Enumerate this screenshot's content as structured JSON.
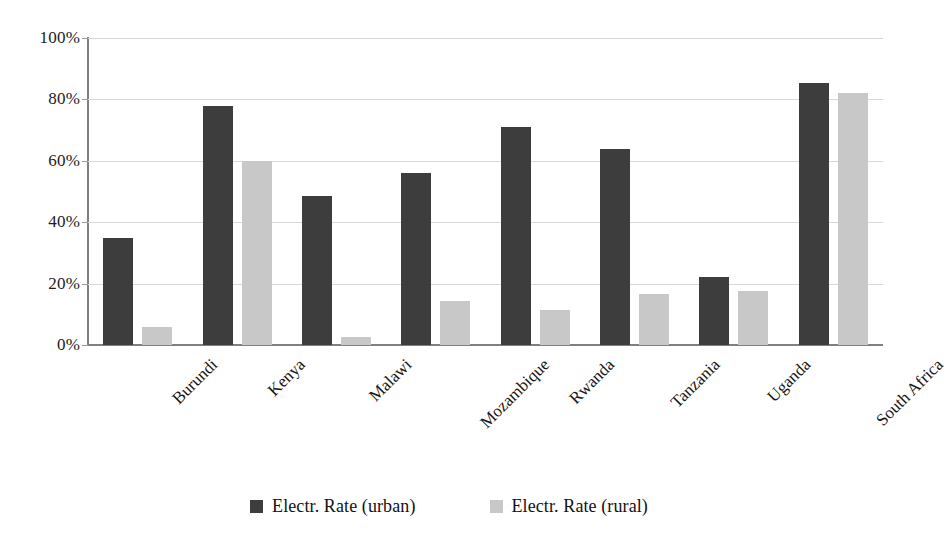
{
  "chart_data": {
    "type": "bar",
    "title": "",
    "xlabel": "",
    "ylabel": "",
    "ylim": [
      0,
      100
    ],
    "ytick_labels": [
      "0%",
      "20%",
      "40%",
      "60%",
      "80%",
      "100%"
    ],
    "ytick_values": [
      0,
      20,
      40,
      60,
      80,
      100
    ],
    "grid": true,
    "legend_position": "bottom-center",
    "categories": [
      "Burundi",
      "Kenya",
      "Malawi",
      "Mozambique",
      "Rwanda",
      "Tanzania",
      "Uganda",
      "South Africa"
    ],
    "series": [
      {
        "name": "Electr. Rate (urban)",
        "color": "#3d3d3d",
        "values": [
          35,
          78,
          48.5,
          56,
          71,
          64,
          22,
          85.5
        ]
      },
      {
        "name": "Electr. Rate (rural)",
        "color": "#c8c8c8",
        "values": [
          6,
          60,
          2.5,
          14.5,
          11.5,
          16.5,
          17.5,
          82
        ]
      }
    ]
  },
  "legend": {
    "items": [
      {
        "label": "Electr. Rate (urban)",
        "swatch": "urban"
      },
      {
        "label": "Electr. Rate (rural)",
        "swatch": "rural"
      }
    ]
  },
  "colors": {
    "urban": "#3d3d3d",
    "rural": "#c8c8c8",
    "gridline": "#d9d9d9",
    "axis": "#808080",
    "text": "#1a1a1a",
    "background": "#ffffff"
  }
}
